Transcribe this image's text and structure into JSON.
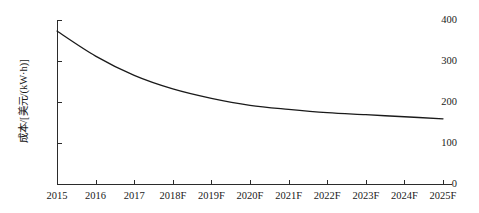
{
  "chart_data": {
    "type": "line",
    "title": "",
    "xlabel": "",
    "ylabel": "成本/[美元/(kW·h)]",
    "categories": [
      "2015",
      "2016",
      "2017",
      "2018F",
      "2019F",
      "2020F",
      "2021F",
      "2022F",
      "2023F",
      "2024F",
      "2025F"
    ],
    "x": [
      2015,
      2016,
      2017,
      2018,
      2019,
      2020,
      2021,
      2022,
      2023,
      2024,
      2025
    ],
    "values": [
      373,
      312,
      265,
      232,
      209,
      192,
      182,
      174,
      169,
      164,
      159
    ],
    "series": [
      {
        "name": "成本",
        "values": [
          373,
          312,
          265,
          232,
          209,
          192,
          182,
          174,
          169,
          164,
          159
        ]
      }
    ],
    "ylim": [
      0,
      400
    ],
    "yticks": [
      0,
      100,
      200,
      300,
      400
    ],
    "ytick_labels": [
      "0",
      "100",
      "200",
      "300",
      "400"
    ],
    "xlim": [
      2015,
      2025
    ],
    "grid": false,
    "legend": false,
    "legend_position": "none",
    "line_color": "#1a1a1a",
    "line_width": 1.3,
    "axis_color": "#2b2b2b",
    "background": "#ffffff"
  },
  "axis": {
    "y_title": "成本/[美元/(kW·h)]"
  }
}
